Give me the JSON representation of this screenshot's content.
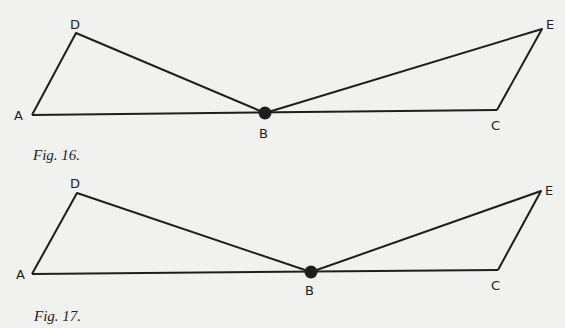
{
  "figures": [
    {
      "caption": "Fig. 16.",
      "points": {
        "A": "A",
        "B": "B",
        "C": "C",
        "D": "D",
        "E": "E"
      }
    },
    {
      "caption": "Fig. 17.",
      "points": {
        "A": "A",
        "B": "B",
        "C": "C",
        "D": "D",
        "E": "E"
      }
    }
  ],
  "colors": {
    "background": "#f1f1ef",
    "ink": "#1e1e1e"
  }
}
